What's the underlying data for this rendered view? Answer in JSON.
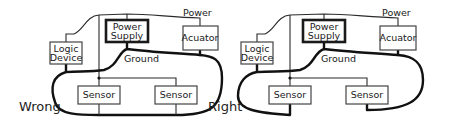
{
  "diagrams": [
    {
      "label": "Wrong",
      "components": {
        "power_supply": [
          "Power",
          "Supply"
        ],
        "logic_device": [
          "Logic",
          "Device"
        ],
        "actuator": "Acuator",
        "sensor_left": "Sensor",
        "sensor_right": "Sensor"
      },
      "wire_labels": {
        "power": "Power",
        "ground": "Ground"
      }
    },
    {
      "label": "Right",
      "components": {
        "power_supply": [
          "Power",
          "Supply"
        ],
        "logic_device": [
          "Logic",
          "Device"
        ],
        "actuator": "Acuator",
        "sensor_left": "Sensor",
        "sensor_right": "Sensor"
      },
      "wire_labels": {
        "power": "Power",
        "ground": "Ground"
      }
    }
  ]
}
